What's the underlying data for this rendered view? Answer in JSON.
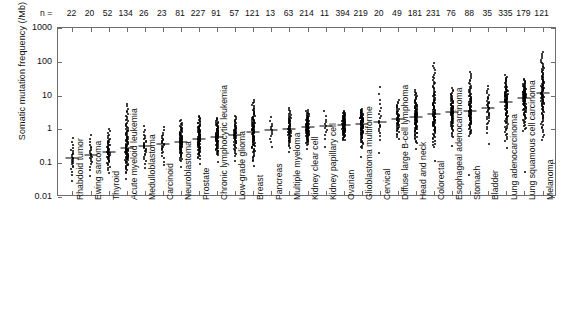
{
  "figure": {
    "y_axis_title": "Somatic mutation frequency (/Mb)",
    "n_prefix": "n =",
    "y_ticks": [
      "1000",
      "100",
      "10",
      "1",
      "0.1",
      "0.01"
    ],
    "y_tick_values": [
      1000,
      100,
      10,
      1,
      0.1,
      0.01
    ]
  },
  "chart_data": {
    "type": "scatter",
    "title": "",
    "xlabel": "",
    "ylabel": "Somatic mutation frequency (/Mb)",
    "ylim": [
      0.01,
      1000
    ],
    "yscale": "log",
    "grid": false,
    "legend": "none",
    "annotation_row_label": "n =",
    "categories": [
      "Rhabdoid tumor",
      "Ewing sarcoma",
      "Thyroid",
      "Acute myeloid leukemia",
      "Medulloblastoma",
      "Carcinoid",
      "Neuroblastoma",
      "Prostate",
      "Chronic lymphocytic leukemia",
      "Low-grade glioma",
      "Breast",
      "Pancreas",
      "Multiple myeloma",
      "Kidney clear cell",
      "Kidney papillary cell",
      "Ovarian",
      "Glioblastoma multiforme",
      "Cervical",
      "Diffuse large B-cell lymphoma",
      "Head and neck",
      "Colorectal",
      "Esophageal adenocarcinoma",
      "Stomach",
      "Bladder",
      "Lung adenocarcinoma",
      "Lung squamous cell carcinoma",
      "Melanoma"
    ],
    "n": [
      22,
      20,
      52,
      134,
      26,
      23,
      81,
      227,
      91,
      57,
      121,
      13,
      63,
      424,
      214,
      11,
      394,
      219,
      20,
      49,
      181,
      231,
      76,
      88,
      35,
      335,
      179,
      121
    ],
    "sample_sizes": [
      22,
      20,
      52,
      134,
      26,
      23,
      81,
      227,
      91,
      57,
      121,
      13,
      63,
      214,
      11,
      394,
      219,
      20,
      49,
      181,
      231,
      76,
      88,
      35,
      335,
      179,
      121
    ],
    "medians": [
      0.14,
      0.18,
      0.22,
      0.28,
      0.32,
      0.38,
      0.42,
      0.52,
      0.6,
      0.7,
      0.85,
      0.95,
      1.05,
      1.15,
      1.25,
      1.35,
      1.45,
      1.7,
      2.0,
      2.4,
      2.9,
      3.2,
      3.6,
      4.2,
      6.5,
      8.5,
      12.0
    ],
    "p05": [
      0.055,
      0.075,
      0.085,
      0.08,
      0.12,
      0.14,
      0.16,
      0.19,
      0.24,
      0.23,
      0.19,
      0.34,
      0.4,
      0.47,
      0.56,
      0.62,
      0.43,
      0.62,
      0.72,
      0.62,
      0.54,
      0.9,
      1.0,
      1.15,
      0.9,
      1.6,
      1.3
    ],
    "p95": [
      0.42,
      0.55,
      0.7,
      2.6,
      0.95,
      0.95,
      1.3,
      1.7,
      1.55,
      1.85,
      4.2,
      2.1,
      3.0,
      2.7,
      3.2,
      2.7,
      3.1,
      12.0,
      5.5,
      9.0,
      38.0,
      11.0,
      26.0,
      14.0,
      25.0,
      22.0,
      95.0
    ],
    "outliers_low": [
      0.03,
      0.042,
      0.05,
      0.035,
      0.07,
      0.09,
      0.075,
      0.095,
      0.11,
      0.12,
      0.08,
      0.0,
      0.22,
      0.26,
      0.3,
      0.0,
      0.15,
      0.2,
      0.0,
      0.27,
      0.12,
      0.33,
      0.045,
      0.38,
      0.28,
      0.055,
      0.48
    ]
  }
}
